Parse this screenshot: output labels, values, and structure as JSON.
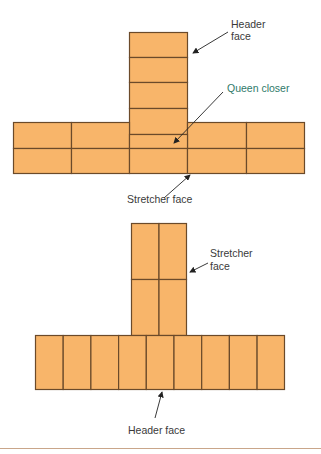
{
  "figure_top": {
    "title": "Brick T-junction plan (stretcher course with header column)",
    "labels": {
      "header_face": [
        "Header",
        "face"
      ],
      "queen_closer": "Queen closer",
      "stretcher_face": "Stretcher face"
    },
    "column_courses": 4,
    "row_bricks_per_course": 5,
    "row_courses": 2
  },
  "figure_bottom": {
    "labels": {
      "stretcher_face": [
        "Stretcher",
        "face"
      ],
      "header_face": "Header face"
    },
    "column_bricks": 4,
    "row_header_bricks": 9
  },
  "colors": {
    "brick_fill": "#f8b56a",
    "brick_stroke": "#6b4a2a",
    "label_text": "#3a3a3a",
    "queen_closer_text": "#2f7a6a",
    "bottom_rule": "#c9a68a"
  }
}
